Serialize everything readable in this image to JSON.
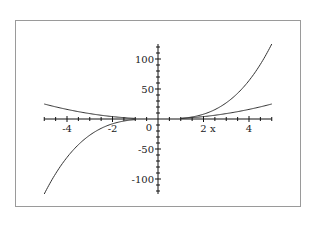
{
  "chart_data": {
    "type": "line",
    "title": "",
    "xlabel": "x",
    "ylabel": "",
    "xlim": [
      -5,
      5
    ],
    "ylim": [
      -125,
      125
    ],
    "grid": false,
    "legend": null,
    "x_ticks": [
      -4,
      -2,
      2,
      4
    ],
    "x_tick_labels": [
      "-4",
      "-2",
      "2",
      "4"
    ],
    "x_minor_step": 0.5,
    "y_ticks": [
      -100,
      -50,
      0,
      50,
      100
    ],
    "y_tick_labels": [
      "-100",
      "-50",
      "0",
      "50",
      "100"
    ],
    "y_minor_step": 10,
    "series": [
      {
        "name": "x^3",
        "domain": [
          [
            -5,
            -1
          ],
          [
            1,
            5
          ]
        ],
        "x": [
          -5,
          -4.5,
          -4,
          -3.5,
          -3,
          -2.5,
          -2,
          -1.5,
          -1,
          1,
          1.5,
          2,
          2.5,
          3,
          3.5,
          4,
          4.5,
          5
        ],
        "y": [
          -125,
          -91.1,
          -64,
          -42.9,
          -27,
          -15.6,
          -8,
          -3.4,
          -1,
          1,
          3.4,
          8,
          15.6,
          27,
          42.9,
          64,
          91.1,
          125
        ]
      },
      {
        "name": "x^2",
        "domain": [
          [
            -5,
            -1
          ],
          [
            1,
            5
          ]
        ],
        "x": [
          -5,
          -4.5,
          -4,
          -3.5,
          -3,
          -2.5,
          -2,
          -1.5,
          -1,
          1,
          1.5,
          2,
          2.5,
          3,
          3.5,
          4,
          4.5,
          5
        ],
        "y": [
          25,
          20.25,
          16,
          12.25,
          9,
          6.25,
          4,
          2.25,
          1,
          1,
          2.25,
          4,
          6.25,
          9,
          12.25,
          16,
          20.25,
          25
        ]
      }
    ]
  },
  "colors": {
    "curve": "#333333",
    "axis": "#111111",
    "frame": "#9a9a9a",
    "background": "#ffffff"
  }
}
